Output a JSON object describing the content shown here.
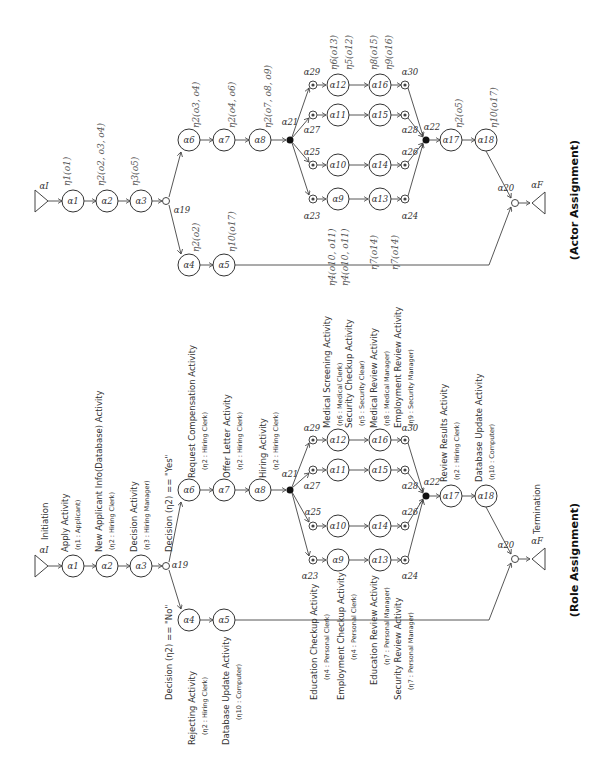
{
  "panels": {
    "actor": {
      "title": "(Actor Assignment)",
      "annotations": {
        "a1": "η1(o1)",
        "a2": "η2(o2, o3, o4)",
        "a3": "η3(o5)",
        "a4": "η2(o2)",
        "a5": "η10(o17)",
        "a6": "η2(o3, o4)",
        "a7": "η2(o4, o6)",
        "a8": "η2(o7, o8, o9)",
        "a9": "η4(o10, o11)",
        "a10": "η4(o10, o11)",
        "a13": "η7(o14)",
        "a14": "η7(o14)",
        "a12": "η6(o13)",
        "a11": "η5(o12)",
        "a16": "η8(o15)",
        "a15": "η9(o16)",
        "a17": "η2(o5)",
        "a18": "η10(o17)"
      }
    },
    "role": {
      "title": "(Role Assignment)",
      "initiation": "Initiation",
      "termination": "Termination",
      "decision_yes": "Decision (η2) == \"Yes\"",
      "decision_no": "Decision (η2) == \"No\"",
      "activities": {
        "a1": {
          "name": "Apply Activity",
          "role": "(η1 : Applicant)"
        },
        "a2": {
          "name": "New Applicant Info(Database) Activity",
          "role": "(η2 : Hiring Clerk)"
        },
        "a3": {
          "name": "Decision Activity",
          "role": "(η3 : Hiring Manager)"
        },
        "a4": {
          "name": "Rejecting Activity",
          "role": "(η2 : Hiring Clerk)"
        },
        "a5": {
          "name": "Database Update Activity",
          "role": "(η10 : Computer)"
        },
        "a6": {
          "name": "Request Compensation Activity",
          "role": "(η2 : Hiring Clerk)"
        },
        "a7": {
          "name": "Offer Letter Activity",
          "role": "(η2 : Hiring Clerk)"
        },
        "a8": {
          "name": "Hiring Activity",
          "role": "(η2 : Hiring Clerk)"
        },
        "a9": {
          "name": "Education Checkup Activity",
          "role": "(η4 : Personal Clerk)"
        },
        "a10": {
          "name": "Employment Checkup Activity",
          "role": "(η4 : Personal Clerk)"
        },
        "a13": {
          "name": "Education Review Activity",
          "role": "(η7 : Personal Manager)"
        },
        "a14": {
          "name": "Security Review Activity",
          "role": "(η7 : Personal Manager)"
        },
        "a12": {
          "name": "Medical Screening Activity",
          "role": "(η6 : Medical Clerk)"
        },
        "a11": {
          "name": "Security Checkup Activity",
          "role": "(η5 : Security Clear)"
        },
        "a16": {
          "name": "Medical Review Activity",
          "role": "(η8 : Medical Manager)"
        },
        "a15": {
          "name": "Employment Review Activity",
          "role": "(η9 : Security Manager)"
        },
        "a17": {
          "name": "Review Results Activity",
          "role": "(η2 : Hiring Clerk)"
        },
        "a18": {
          "name": "Database Update Activity",
          "role": "(η10 : Computer)"
        }
      }
    }
  },
  "nodes": {
    "aI": "αI",
    "aF": "αF",
    "a1": "α1",
    "a2": "α2",
    "a3": "α3",
    "a4": "α4",
    "a5": "α5",
    "a6": "α6",
    "a7": "α7",
    "a8": "α8",
    "a9": "α9",
    "a10": "α10",
    "a11": "α11",
    "a12": "α12",
    "a13": "α13",
    "a14": "α14",
    "a15": "α15",
    "a16": "α16",
    "a17": "α17",
    "a18": "α18",
    "a19": "α19",
    "a20": "α20",
    "a21": "α21",
    "a22": "α22",
    "a23": "α23",
    "a24": "α24",
    "a25": "α25",
    "a26": "α26",
    "a27": "α27",
    "a28": "α28",
    "a29": "α29",
    "a30": "α30"
  }
}
